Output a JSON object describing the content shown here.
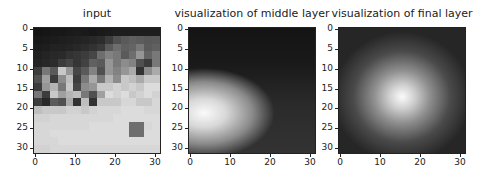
{
  "chart_data": [
    {
      "type": "heatmap",
      "title": "input",
      "colormap": "gray",
      "xlim": [
        0,
        31
      ],
      "ylim": [
        31,
        0
      ],
      "xticks": [
        "0",
        "10",
        "20",
        "30"
      ],
      "yticks": [
        "0",
        "5",
        "10",
        "15",
        "20",
        "25",
        "30"
      ],
      "description": "32x32 grayscale input image; dark top half, bright lower region with mixed textures"
    },
    {
      "type": "heatmap",
      "title": "visualization of middle layer",
      "colormap": "gray",
      "xlim": [
        0,
        31
      ],
      "ylim": [
        31,
        0
      ],
      "xticks": [
        "0",
        "10",
        "20",
        "30"
      ],
      "yticks": [
        "0",
        "5",
        "10",
        "15",
        "20",
        "25",
        "30"
      ],
      "peak": {
        "x": 4,
        "y": 22
      }
    },
    {
      "type": "heatmap",
      "title": "visualization of final layer",
      "colormap": "gray",
      "xlim": [
        0,
        31
      ],
      "ylim": [
        31,
        0
      ],
      "xticks": [
        "0",
        "10",
        "20",
        "30"
      ],
      "yticks": [
        "0",
        "5",
        "10",
        "15",
        "20",
        "25",
        "30"
      ],
      "peak": {
        "x": 16,
        "y": 17
      }
    }
  ],
  "titles": [
    "input",
    "visualization of middle layer",
    "visualization of final layer"
  ],
  "xticks": [
    "0",
    "10",
    "20",
    "30"
  ],
  "yticks": [
    "0",
    "5",
    "10",
    "15",
    "20",
    "25",
    "30"
  ],
  "input_grid": [
    [
      20,
      22,
      24,
      24,
      26,
      28,
      26,
      24,
      26,
      28,
      30,
      30,
      30,
      30,
      30,
      30
    ],
    [
      24,
      26,
      28,
      30,
      32,
      34,
      36,
      40,
      44,
      60,
      80,
      90,
      96,
      92,
      88,
      90
    ],
    [
      28,
      30,
      34,
      34,
      36,
      40,
      44,
      50,
      58,
      90,
      110,
      96,
      100,
      120,
      90,
      96
    ],
    [
      32,
      36,
      40,
      42,
      50,
      54,
      60,
      70,
      110,
      130,
      120,
      90,
      110,
      150,
      100,
      120
    ],
    [
      36,
      40,
      44,
      60,
      70,
      54,
      66,
      96,
      90,
      150,
      120,
      140,
      130,
      80,
      60,
      120
    ],
    [
      60,
      120,
      90,
      200,
      150,
      70,
      90,
      130,
      80,
      150,
      130,
      150,
      170,
      50,
      140,
      170
    ],
    [
      80,
      160,
      60,
      140,
      190,
      60,
      120,
      170,
      120,
      180,
      140,
      200,
      190,
      170,
      200,
      200
    ],
    [
      60,
      150,
      180,
      120,
      200,
      70,
      140,
      150,
      200,
      200,
      210,
      200,
      210,
      200,
      220,
      220
    ],
    [
      120,
      60,
      200,
      160,
      180,
      190,
      120,
      80,
      160,
      220,
      210,
      220,
      200,
      210,
      220,
      210
    ],
    [
      60,
      40,
      90,
      80,
      170,
      50,
      190,
      50,
      200,
      200,
      200,
      215,
      215,
      200,
      200,
      215
    ],
    [
      190,
      200,
      200,
      200,
      210,
      210,
      200,
      210,
      215,
      215,
      215,
      220,
      220,
      220,
      215,
      215
    ],
    [
      210,
      210,
      215,
      215,
      215,
      215,
      215,
      215,
      215,
      215,
      220,
      220,
      220,
      220,
      220,
      220
    ],
    [
      215,
      215,
      215,
      215,
      215,
      215,
      215,
      220,
      220,
      220,
      220,
      220,
      110,
      110,
      215,
      220
    ],
    [
      215,
      215,
      220,
      220,
      220,
      220,
      220,
      220,
      220,
      220,
      220,
      220,
      110,
      110,
      220,
      220
    ],
    [
      215,
      215,
      215,
      220,
      220,
      220,
      220,
      220,
      220,
      220,
      220,
      220,
      220,
      220,
      220,
      220
    ],
    [
      210,
      210,
      215,
      215,
      215,
      215,
      215,
      215,
      215,
      215,
      215,
      215,
      215,
      215,
      215,
      215
    ]
  ]
}
